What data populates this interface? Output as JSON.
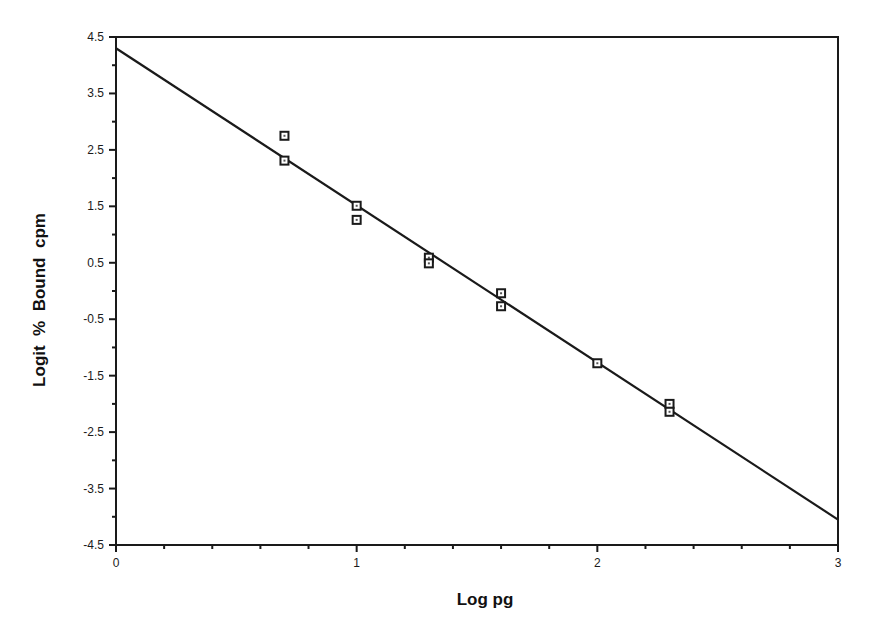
{
  "chart_data": {
    "type": "scatter",
    "title": "",
    "xlabel": "Log pg",
    "ylabel": "Logit  %  Bound  cpm",
    "xlim": [
      0,
      3
    ],
    "ylim": [
      -4.5,
      4.5
    ],
    "x_ticks": [
      0,
      1,
      2,
      3
    ],
    "x_tick_labels": [
      "0",
      "1",
      "2",
      "3"
    ],
    "x_minor_step": 0.2,
    "y_ticks": [
      4.5,
      3.5,
      2.5,
      1.5,
      0.5,
      -0.5,
      -1.5,
      -2.5,
      -3.5,
      -4.5
    ],
    "y_tick_labels": [
      "4.5",
      "3.5",
      "2.5",
      "1.5",
      "0.5",
      "-0.5",
      "-1.5",
      "-2.5",
      "-3.5",
      "-4.5"
    ],
    "y_minor_step": 0.5,
    "grid": false,
    "legend": null,
    "series": [
      {
        "name": "Standards",
        "marker": "square",
        "points": [
          {
            "x": 0.7,
            "y": 2.75
          },
          {
            "x": 0.7,
            "y": 2.31
          },
          {
            "x": 1.0,
            "y": 1.51
          },
          {
            "x": 1.0,
            "y": 1.26
          },
          {
            "x": 1.3,
            "y": 0.59
          },
          {
            "x": 1.3,
            "y": 0.49
          },
          {
            "x": 1.6,
            "y": -0.04
          },
          {
            "x": 1.6,
            "y": -0.27
          },
          {
            "x": 2.0,
            "y": -1.28
          },
          {
            "x": 2.3,
            "y": -2.0
          },
          {
            "x": 2.3,
            "y": -2.14
          }
        ]
      },
      {
        "name": "Linear fit",
        "type": "line",
        "points": [
          {
            "x": 0,
            "y": 4.3
          },
          {
            "x": 3,
            "y": -4.05
          }
        ]
      }
    ]
  },
  "colors": {
    "ink": "#1a1a1a",
    "background": "#ffffff"
  }
}
